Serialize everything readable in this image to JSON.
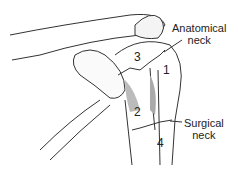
{
  "diagram": {
    "labels": {
      "anatomical_neck": [
        "Anatomical",
        "neck"
      ],
      "surgical_neck": [
        "Surgical",
        "neck"
      ]
    },
    "parts": [
      "1",
      "2",
      "3",
      "4"
    ]
  }
}
